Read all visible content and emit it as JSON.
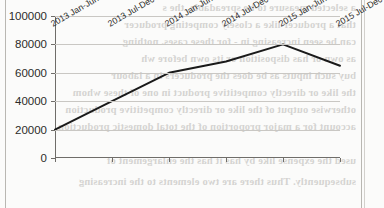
{
  "page": {
    "background_color": "#fbfbfa",
    "border_color": "#b9b7b2",
    "bleed_text": [
      "a selected measure to be spreadable, the s",
      "that a producer like a closely competing producer",
      "can be seen increasing in - for these cases. nothing",
      "as own or has  disposition  or  its  own  before  wh",
      "buy such inputs as be does the  producers in a labour",
      "the like or directly competitive product in one of these whom",
      "otherwise output of the like or directly competitive production",
      "account for a major proportion of the total domestic production",
      "used  the expense  like  by  has  it  has  the  enlargement  of",
      "subsequently. Thus there are two elements to the increasing"
    ]
  },
  "chart_data": {
    "type": "line",
    "title": "",
    "xlabel": "",
    "ylabel": "",
    "categories": [
      "2013 Jan-Jun",
      "2013 Jul-Dec",
      "2014 Jan-Jun",
      "2014 Jul-Dec",
      "2015 Jan-Jun",
      "2015 Jul-Dec"
    ],
    "values": [
      20000,
      40000,
      60000,
      68000,
      80000,
      65000
    ],
    "ylim": [
      0,
      100000
    ],
    "ytick_labels": [
      "0",
      "20000",
      "40000",
      "60000",
      "80000",
      "100000"
    ],
    "ytick_values": [
      0,
      20000,
      40000,
      60000,
      80000,
      100000
    ],
    "grid": true,
    "grid_color": "#c9c7c3",
    "legend": "none",
    "line_color": "#1a1a1a",
    "line_width": 2,
    "markers": false,
    "series_name": ""
  }
}
